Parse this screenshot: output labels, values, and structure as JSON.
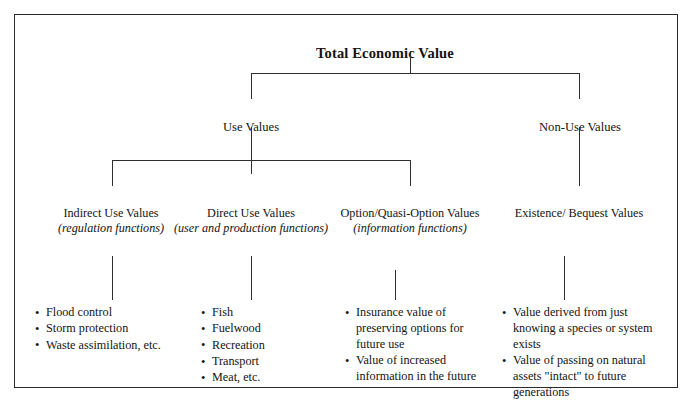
{
  "diagram": {
    "type": "hierarchy-tree",
    "root": {
      "id": "total-economic-value",
      "label": "Total Economic Value"
    },
    "level2": [
      {
        "id": "use-values",
        "label": "Use Values"
      },
      {
        "id": "non-use-values",
        "label": "Non-Use Values"
      }
    ],
    "categories": [
      {
        "id": "indirect-use-values",
        "title": "Indirect Use Values",
        "subtitle": "(regulation functions)",
        "items": [
          "Flood control",
          "Storm protection",
          "Waste assimilation, etc."
        ]
      },
      {
        "id": "direct-use-values",
        "title": "Direct Use Values",
        "subtitle": "(user and production functions)",
        "items": [
          "Fish",
          "Fuelwood",
          "Recreation",
          "Transport",
          "Meat, etc."
        ]
      },
      {
        "id": "option-quasi-option-values",
        "title": "Option/Quasi-Option Values",
        "subtitle": "(information functions)",
        "items": [
          "Insurance value of preserving options for future use",
          "Value of increased information in the future"
        ]
      },
      {
        "id": "existence-bequest-values",
        "title": "Existence/ Bequest Values",
        "subtitle": "",
        "items": [
          "Value derived from just knowing a species or system exists",
          "Value of passing on natural assets \"intact\" to future generations"
        ]
      }
    ],
    "bullet_glyph": "•",
    "colors": {
      "line": "#2f2f2f",
      "border": "#2b2b2b",
      "text": "#141414",
      "background": "#ffffff"
    }
  }
}
